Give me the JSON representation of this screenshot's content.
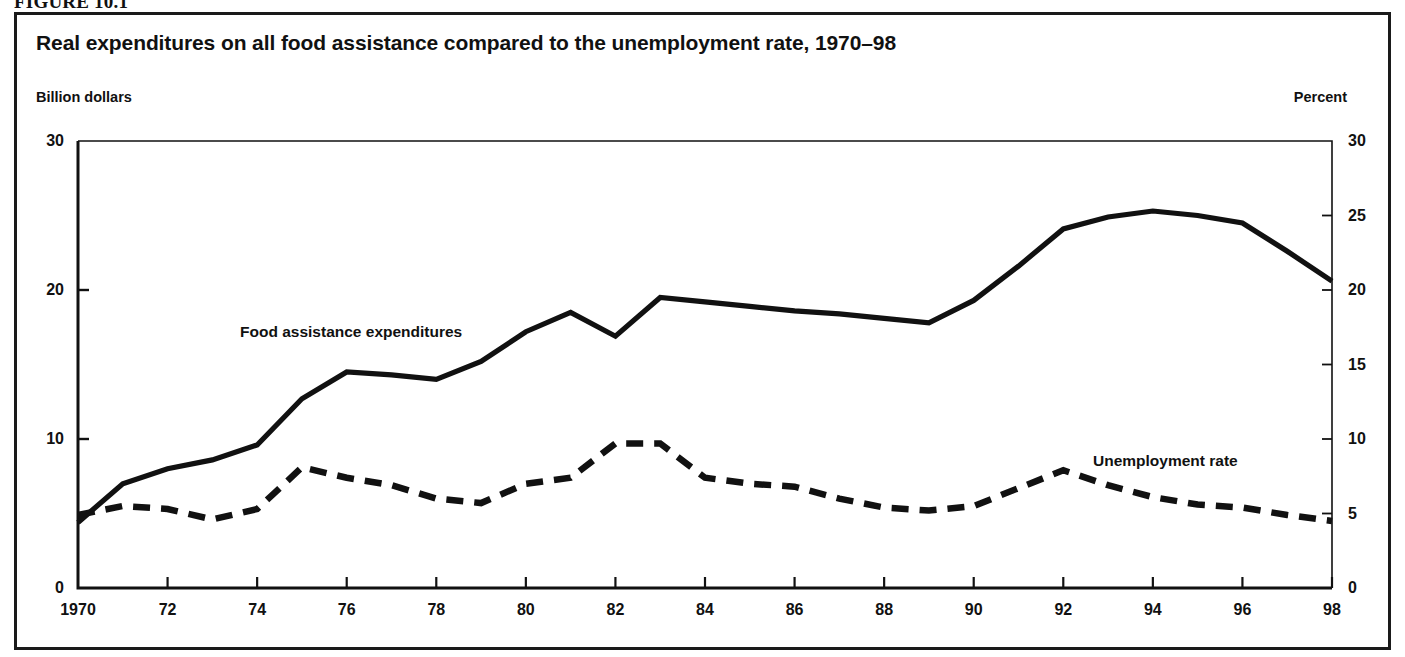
{
  "figure": {
    "caption": "FIGURE 10.1"
  },
  "chart_data": {
    "type": "line",
    "title": "Real expenditures on all food assistance compared to the unemployment rate, 1970–98",
    "xlabel": "",
    "ylabel": "Billion dollars",
    "y2label": "Percent",
    "grid": false,
    "legend_position": "inline-annotation",
    "xlim": [
      1970,
      1998
    ],
    "ylim": [
      0,
      30
    ],
    "y2lim": [
      0,
      30
    ],
    "yticks": [
      0,
      10,
      20,
      30
    ],
    "ytick_labels": [
      "0",
      "10",
      "20",
      "30"
    ],
    "y2ticks": [
      0,
      5,
      10,
      15,
      20,
      25,
      30
    ],
    "y2tick_labels": [
      "0",
      "5",
      "10",
      "15",
      "20",
      "25",
      "30"
    ],
    "xticks": [
      1970,
      1972,
      1974,
      1976,
      1978,
      1980,
      1982,
      1984,
      1986,
      1988,
      1990,
      1992,
      1994,
      1996,
      1998
    ],
    "xtick_labels": [
      "1970",
      "72",
      "74",
      "76",
      "78",
      "80",
      "82",
      "84",
      "86",
      "88",
      "90",
      "92",
      "94",
      "96",
      "98"
    ],
    "x": [
      1970,
      1971,
      1972,
      1973,
      1974,
      1975,
      1976,
      1977,
      1978,
      1979,
      1980,
      1981,
      1982,
      1983,
      1984,
      1985,
      1986,
      1987,
      1988,
      1989,
      1990,
      1991,
      1992,
      1993,
      1994,
      1995,
      1996,
      1997,
      1998
    ],
    "series": [
      {
        "name": "Food assistance expenditures",
        "axis": "left",
        "units": "Billion dollars",
        "style": "solid",
        "color": "#111111",
        "values": [
          4.4,
          7.0,
          8.0,
          8.6,
          9.6,
          12.7,
          14.5,
          14.3,
          14.0,
          15.2,
          17.2,
          18.5,
          16.9,
          19.5,
          19.2,
          18.9,
          18.6,
          18.4,
          18.1,
          17.8,
          19.3,
          21.6,
          24.1,
          24.9,
          25.3,
          25.0,
          24.5,
          22.6,
          20.6
        ]
      },
      {
        "name": "Unemployment rate",
        "axis": "right",
        "units": "Percent",
        "style": "dashed",
        "color": "#111111",
        "values": [
          4.9,
          5.5,
          5.3,
          4.6,
          5.3,
          8.1,
          7.4,
          6.9,
          6.0,
          5.7,
          7.0,
          7.4,
          9.7,
          9.7,
          7.4,
          7.0,
          6.8,
          6.0,
          5.4,
          5.2,
          5.5,
          6.7,
          7.9,
          6.9,
          6.1,
          5.6,
          5.4,
          4.9,
          4.5
        ]
      }
    ],
    "annotations": [
      {
        "text": "Food assistance expenditures",
        "x": 1975.3,
        "y": 16.2
      },
      {
        "text": "Unemployment rate",
        "x": 1992.5,
        "y": 7.9
      }
    ]
  }
}
